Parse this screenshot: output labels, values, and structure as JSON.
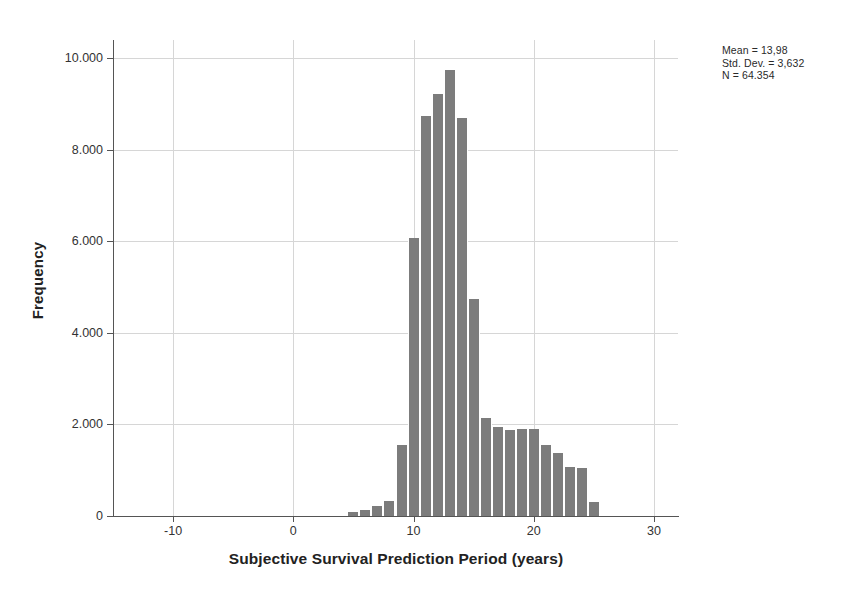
{
  "chart_data": {
    "type": "bar",
    "title": "",
    "subtitle": "",
    "xlabel": "Subjective Survival Prediction Period (years)",
    "ylabel": "Frequency",
    "xlim": [
      -15,
      32
    ],
    "ylim": [
      0,
      10400
    ],
    "grid": true,
    "legend": null,
    "bin_width": 1,
    "x_ticks": [
      {
        "value": -10,
        "label": "-10"
      },
      {
        "value": 0,
        "label": "0"
      },
      {
        "value": 10,
        "label": "10"
      },
      {
        "value": 20,
        "label": "20"
      },
      {
        "value": 30,
        "label": "30"
      }
    ],
    "y_ticks": [
      {
        "value": 0,
        "label": "0"
      },
      {
        "value": 2000,
        "label": "2.000"
      },
      {
        "value": 4000,
        "label": "4.000"
      },
      {
        "value": 6000,
        "label": "6.000"
      },
      {
        "value": 8000,
        "label": "8.000"
      },
      {
        "value": 10000,
        "label": "10.000"
      }
    ],
    "bar_color": "#7c7c7c",
    "grid_color": "#d6d6d6",
    "axis_color": "#555555",
    "categories": [
      5,
      6,
      7,
      8,
      9,
      10,
      11,
      12,
      13,
      14,
      15,
      16,
      17,
      18,
      19,
      20,
      21,
      22,
      23,
      24,
      25
    ],
    "values": [
      80,
      140,
      210,
      330,
      1560,
      6080,
      8750,
      9220,
      9750,
      8700,
      4750,
      2150,
      1950,
      1880,
      1900,
      1900,
      1560,
      1380,
      1070,
      1060,
      300
    ],
    "annotations": {
      "mean_label": "Mean = 13,98",
      "std_dev_label": "Std. Dev. = 3,632",
      "n_label": "N = 64.354",
      "mean_value": 13.98,
      "std_dev_value": 3.632,
      "n_value": 64354
    }
  },
  "axes": {
    "x_title": "Subjective Survival Prediction Period (years)",
    "y_title": "Frequency"
  },
  "stats": {
    "mean": "Mean = 13,98",
    "std_dev": "Std. Dev. = 3,632",
    "n": "N = 64.354"
  }
}
